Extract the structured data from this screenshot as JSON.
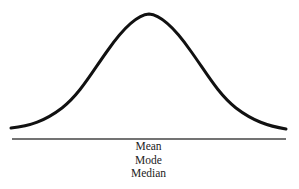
{
  "diagram": {
    "type": "normal-distribution-curve",
    "curve_color": "#111111",
    "baseline_color": "#444444",
    "center_labels": [
      "Mean",
      "Mode",
      "Median"
    ]
  }
}
